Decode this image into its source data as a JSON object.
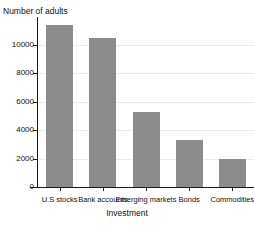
{
  "chart_data": {
    "type": "bar",
    "title": "Investment accounts",
    "xlabel": "Investment",
    "ylabel": "Number of adults",
    "categories": [
      "U.S stocks",
      "Bank accounts",
      "Emerging markets",
      "Bonds",
      "Commodities"
    ],
    "values": [
      11400,
      10450,
      5300,
      3300,
      1950
    ],
    "yticks": [
      0,
      2000,
      4000,
      6000,
      8000,
      10000
    ],
    "ytick_labels": [
      "0",
      "2000",
      "4000",
      "6000",
      "8000",
      "10000"
    ],
    "ylim": [
      0,
      11800
    ],
    "grid": true,
    "legend": false,
    "bar_color": "#8c8c8c",
    "gridline_color": "#ececed",
    "axis_color": "#1a1a1a"
  }
}
